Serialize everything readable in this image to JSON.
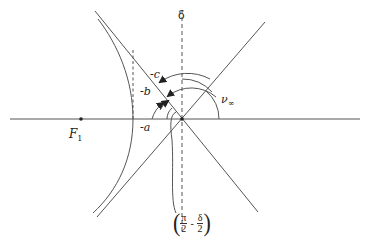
{
  "diagram": {
    "type": "hyperbolic trajectory geometry",
    "labels": {
      "delta": "δ",
      "neg_c": "-c",
      "neg_b": "-b",
      "neg_a": "-a",
      "nu_inf_symbol": "ν",
      "nu_inf_sub": "∞",
      "focus_symbol": "F",
      "focus_sub": "1",
      "bracket_pi": "π",
      "bracket_2a": "2",
      "bracket_minus": "-",
      "bracket_delta": "δ",
      "bracket_2b": "2",
      "open_paren": "(",
      "close_paren": ")"
    },
    "colors": {
      "line": "#444444",
      "background": "#ffffff"
    }
  }
}
